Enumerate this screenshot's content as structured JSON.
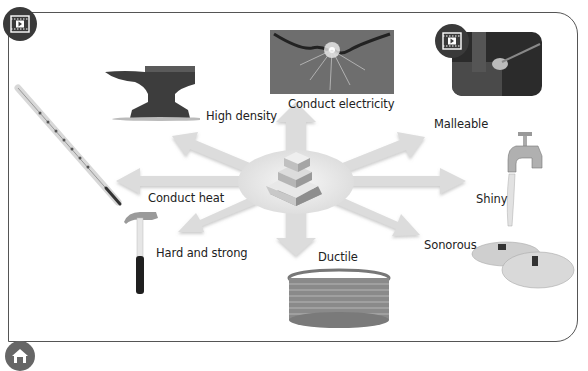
{
  "diagram": {
    "center": "metal-bars",
    "properties": [
      {
        "label": "High density",
        "image": "anvil"
      },
      {
        "label": "Conduct electricity",
        "image": "electric-sparks"
      },
      {
        "label": "Malleable",
        "image": "metal-forging-video"
      },
      {
        "label": "Conduct heat",
        "image": "thermometer"
      },
      {
        "label": "Shiny",
        "image": "water-tap"
      },
      {
        "label": "Hard and strong",
        "image": "hammer"
      },
      {
        "label": "Ductile",
        "image": "wire-coil"
      },
      {
        "label": "Sonorous",
        "image": "cymbals"
      }
    ]
  },
  "controls": {
    "video_button": "play-video",
    "home_button": "home"
  },
  "colors": {
    "arrow": "#d9d9d9",
    "frame": "#555555",
    "button_bg": "#3a3a3a"
  }
}
